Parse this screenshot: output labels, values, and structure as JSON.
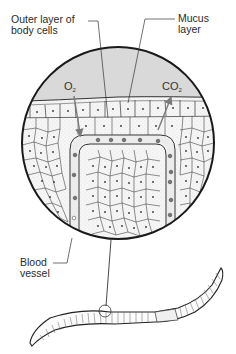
{
  "diagram": {
    "type": "biology-cross-section",
    "labels": {
      "outer_layer_line1": "Outer layer of",
      "outer_layer_line2": "body cells",
      "mucus_line1": "Mucus",
      "mucus_line2": "layer",
      "blood_line1": "Blood",
      "blood_line2": "vessel"
    },
    "gases": {
      "oxygen_base": "O",
      "oxygen_sub": "2",
      "carbon_dioxide_base": "CO",
      "carbon_dioxide_sub": "2"
    },
    "arrows": [
      {
        "gas": "O2",
        "direction": "inward",
        "from": "mucus/air region",
        "to": "blood vessel"
      },
      {
        "gas": "CO2",
        "direction": "outward",
        "from": "blood vessel",
        "to": "mucus/air region"
      }
    ],
    "colors": {
      "outline": "#1a1a1a",
      "mucus_fill": "#d9d9d9",
      "cell_fill": "#f4f4f4",
      "arrow": "#7a7a7a",
      "background": "#ffffff"
    }
  }
}
